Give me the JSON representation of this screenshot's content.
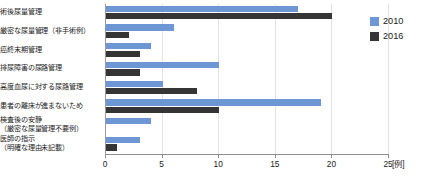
{
  "chart_data": {
    "type": "bar",
    "orientation": "horizontal",
    "title": "",
    "xlabel": "[例]",
    "ylabel": "",
    "xlim": [
      0,
      25
    ],
    "xticks": [
      0,
      5,
      10,
      15,
      20,
      25
    ],
    "xtick_labels": [
      "0",
      "5",
      "10",
      "15",
      "20",
      "25"
    ],
    "unit_label": "[例]",
    "grid": true,
    "legend_position": "right-top",
    "categories": [
      "術後尿量管理",
      "厳密な尿量管理（非手術例）",
      "癌終末期管理",
      "排尿障害の尿路管理",
      "高度血尿に対する尿路管理",
      "患者の離床が進まないため",
      "検査後の安静\n（厳密な尿量管理不要例）",
      "医師の指示\n（明確な理由未記載）"
    ],
    "category_lines": [
      [
        "術後尿量管理"
      ],
      [
        "厳密な尿量管理（非手術例）"
      ],
      [
        "癌終末期管理"
      ],
      [
        "排尿障害の尿路管理"
      ],
      [
        "高度血尿に対する尿路管理"
      ],
      [
        "患者の離床が進まないため"
      ],
      [
        "検査後の安静",
        "（厳密な尿量管理不要例）"
      ],
      [
        "医師の指示",
        "（明確な理由未記載）"
      ]
    ],
    "series": [
      {
        "name": "2010",
        "color": "#6d96d4",
        "values": [
          17,
          6,
          4,
          10,
          5,
          19,
          4,
          3
        ]
      },
      {
        "name": "2016",
        "color": "#353535",
        "values": [
          20,
          2,
          3,
          3,
          8,
          10,
          0,
          1
        ]
      }
    ]
  },
  "legend": {
    "items": [
      {
        "label": "2010",
        "color": "#6d96d4"
      },
      {
        "label": "2016",
        "color": "#353535"
      }
    ]
  }
}
